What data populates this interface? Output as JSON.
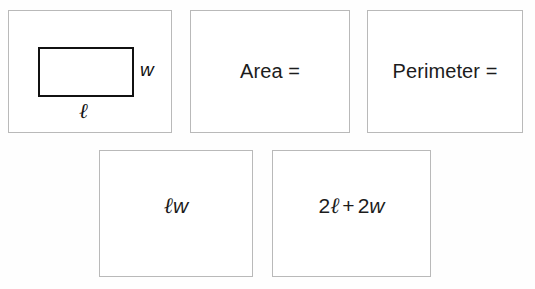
{
  "worksheet": {
    "title": "Rectangle area and perimeter formula cards",
    "background_color": "#ffffff",
    "card_border_color": "#b9b9b9",
    "ink_color": "#1c1c1c"
  },
  "cards": [
    {
      "id": "figure",
      "type": "diagram",
      "name": "labeled-rectangle",
      "labels": {
        "width": "w",
        "length": "ℓ"
      }
    },
    {
      "id": "area",
      "type": "text",
      "text": "Area ="
    },
    {
      "id": "perimeter",
      "type": "text",
      "text": "Perimeter ="
    },
    {
      "id": "area-expression",
      "type": "expression",
      "text": "ℓw",
      "parts": {
        "length_symbol": "ℓ",
        "width_symbol": "w"
      }
    },
    {
      "id": "perimeter-expression",
      "type": "expression",
      "text": "2ℓ + 2w",
      "parts": {
        "coefficient_one": "2",
        "length_symbol": "ℓ",
        "operator": "+",
        "coefficient_two": "2",
        "width_symbol": "w"
      }
    }
  ]
}
